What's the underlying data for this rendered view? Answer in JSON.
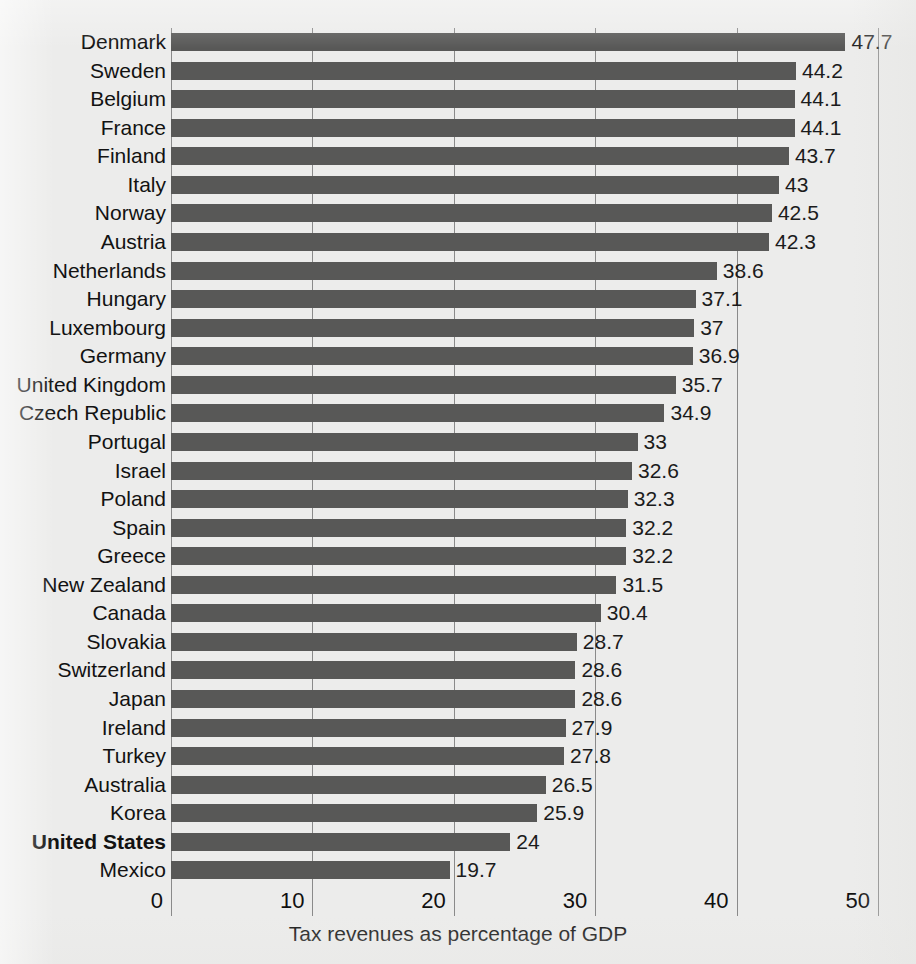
{
  "chart_data": {
    "type": "bar",
    "orientation": "horizontal",
    "title": "",
    "xlabel": "Tax revenues as percentage of GDP",
    "ylabel": "",
    "xlim": [
      0,
      50
    ],
    "xticks": [
      "0",
      "10",
      "20",
      "30",
      "40",
      "50"
    ],
    "grid": "vertical",
    "legend": "none",
    "bar_color": "#585857",
    "highlight_category": "United States",
    "categories": [
      "Denmark",
      "Sweden",
      "Belgium",
      "France",
      "Finland",
      "Italy",
      "Norway",
      "Austria",
      "Netherlands",
      "Hungary",
      "Luxembourg",
      "Germany",
      "United Kingdom",
      "Czech Republic",
      "Portugal",
      "Israel",
      "Poland",
      "Spain",
      "Greece",
      "New Zealand",
      "Canada",
      "Slovakia",
      "Switzerland",
      "Japan",
      "Ireland",
      "Turkey",
      "Australia",
      "Korea",
      "United States",
      "Mexico"
    ],
    "values": [
      47.7,
      44.2,
      44.1,
      44.1,
      43.7,
      43,
      42.5,
      42.3,
      38.6,
      37.1,
      37,
      36.9,
      35.7,
      34.9,
      33,
      32.6,
      32.3,
      32.2,
      32.2,
      31.5,
      30.4,
      28.7,
      28.6,
      28.6,
      27.9,
      27.8,
      26.5,
      25.9,
      24,
      19.7
    ],
    "value_labels": [
      "47.7",
      "44.2",
      "44.1",
      "44.1",
      "43.7",
      "43",
      "42.5",
      "42.3",
      "38.6",
      "37.1",
      "37",
      "36.9",
      "35.7",
      "34.9",
      "33",
      "32.6",
      "32.3",
      "32.2",
      "32.2",
      "31.5",
      "30.4",
      "28.7",
      "28.6",
      "28.6",
      "27.9",
      "27.8",
      "26.5",
      "25.9",
      "24",
      "19.7"
    ]
  }
}
